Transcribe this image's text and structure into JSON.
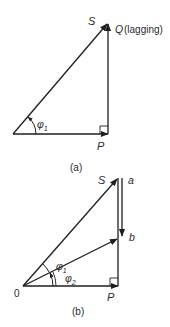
{
  "figure": {
    "colors": {
      "line": "#1e1e1e",
      "text": "#2a2a2a",
      "background": "#ffffff"
    },
    "diagram_a": {
      "caption": "(a)",
      "label_s": "S",
      "label_q": "Q",
      "label_q_note": "(lagging)",
      "label_p": "P",
      "angle_symbol": "φ",
      "angle_subscript": "1"
    },
    "diagram_b": {
      "caption": "(b)",
      "label_s": "S",
      "label_a": "a",
      "label_b": "b",
      "label_origin": "0",
      "label_p": "P",
      "angle1_symbol": "φ",
      "angle1_subscript": "1",
      "angle2_symbol": "φ",
      "angle2_subscript": "2"
    }
  }
}
